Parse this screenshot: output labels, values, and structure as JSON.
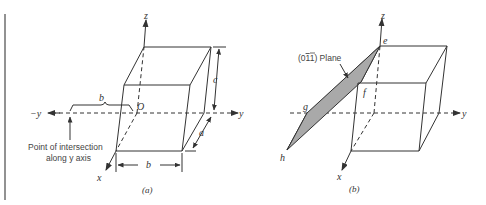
{
  "figure": {
    "panel_a": {
      "caption": "(a)",
      "axis_labels": {
        "z": "z",
        "y": "y",
        "neg_y": "−y",
        "x": "x",
        "origin": "O"
      },
      "dimensions": {
        "a": "a",
        "b_top": "b",
        "b_bottom": "b",
        "c": "c"
      },
      "annotation_line1": "Point of intersection",
      "annotation_line2": "along y axis"
    },
    "panel_b": {
      "caption": "(b)",
      "axis_labels": {
        "z": "z",
        "y": "y",
        "x": "x"
      },
      "plane_label": "(0ī1) Plane",
      "plane_label_prefix": "(0",
      "plane_label_bar": "1",
      "plane_label_suffix": "1) Plane",
      "vertices": {
        "e": "e",
        "f": "f",
        "g": "g",
        "h": "h"
      },
      "plane_fill": "#a9a9a9"
    },
    "colors": {
      "line": "#333333",
      "plane": "#a9a9a9",
      "border": "#666666"
    }
  }
}
